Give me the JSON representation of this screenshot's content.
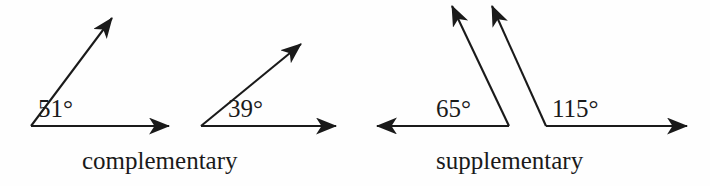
{
  "figure": {
    "background_color": "#fefefe",
    "stroke_color": "#1a1a1a",
    "text_color": "#1a1a1a",
    "width": 710,
    "height": 186
  },
  "groups": [
    {
      "caption": "complementary",
      "angles": [
        {
          "label": "51°",
          "value": 51
        },
        {
          "label": "39°",
          "value": 39
        }
      ],
      "sum_label": "90°"
    },
    {
      "caption": "supplementary",
      "angles": [
        {
          "label": "65°",
          "value": 65
        },
        {
          "label": "115°",
          "value": 115
        }
      ],
      "sum_label": "180°"
    }
  ],
  "labels": {
    "angle_51": "51°",
    "angle_39": "39°",
    "angle_65": "65°",
    "angle_115": "115°",
    "caption_complementary": "complementary",
    "caption_supplementary": "supplementary"
  }
}
